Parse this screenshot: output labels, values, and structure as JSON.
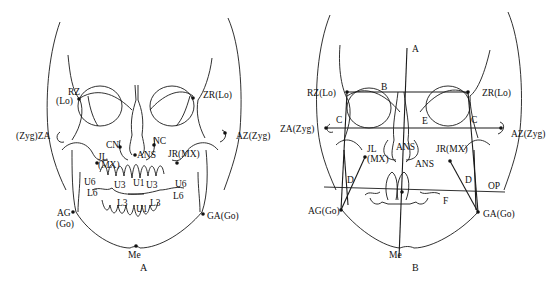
{
  "figure": {
    "panels": [
      {
        "caption": "A",
        "labels": {
          "rz": "RZ",
          "rz_lo": "(Lo)",
          "zr": "ZR(Lo)",
          "za": "(Zyg)ZA",
          "az": "AZ(Zyg)",
          "cn": "CN",
          "nc": "NC",
          "ans": "ANS",
          "jl": "JL",
          "jl_mx": "(MX)",
          "jr": "JR(MX)",
          "u6_left": "U6",
          "l6_left": "L6",
          "u6_right": "U6",
          "l6_right": "L6",
          "u3_left": "U3",
          "u1_top": "U1",
          "u3_right": "U3",
          "l3_left": "L3",
          "u1_bottom": "U1",
          "l3_right": "L3",
          "ag": "AG",
          "ag_go": "(Go)",
          "ga": "GA(Go)",
          "me": "Me"
        }
      },
      {
        "caption": "B",
        "labels": {
          "a_line": "A",
          "b_line": "B",
          "rz": "RZ(Lo)",
          "zr": "ZR(Lo)",
          "c_left": "C",
          "c_right": "C",
          "e_line": "E",
          "za": "ZA(Zyg)",
          "az": "AZ(Zyg)",
          "ans_upper": "ANS",
          "ans_lower": "ANS",
          "jl": "JL",
          "jl_mx": "(MX)",
          "jr": "JR(MX)",
          "d_left": "D",
          "d_right": "D",
          "op": "OP",
          "f_line": "F",
          "ag": "AG(Go)",
          "ga": "GA(Go)",
          "me": "Me"
        }
      }
    ]
  },
  "colors": {
    "stroke": "#1a1a1a",
    "background": "#ffffff"
  }
}
